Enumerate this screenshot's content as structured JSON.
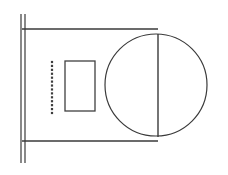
{
  "drawing": {
    "title": "Technical line drawing",
    "canvas": {
      "width": 228,
      "height": 175,
      "background_color": "#ffffff"
    },
    "line_color": "#3a3a3a",
    "shapes": {
      "wall": {
        "name": "double vertical line",
        "line_1_x": 21,
        "line_2_x": 25,
        "y_top": 14,
        "y_bottom": 163,
        "stroke_width": 1.2
      },
      "top_rail": {
        "name": "upper horizontal line",
        "x_start": 22,
        "x_end": 158,
        "y": 29,
        "stroke_width": 1.3
      },
      "bottom_rail": {
        "name": "lower horizontal line",
        "x_start": 22,
        "x_end": 158,
        "y": 141,
        "stroke_width": 1.3
      },
      "circle": {
        "name": "large circle",
        "center_x": 156,
        "center_y": 85,
        "radius": 51,
        "stroke_width": 1.2
      },
      "chord": {
        "name": "vertical chord line through circle",
        "x": 158,
        "y_top": 34,
        "y_bottom": 137,
        "stroke_width": 1.4
      },
      "inner_rectangle": {
        "name": "small rectangle",
        "x": 65,
        "y": 61,
        "width": 30,
        "height": 50,
        "stroke_width": 1.3
      },
      "dot_column": {
        "name": "vertical dotted column",
        "x": 52,
        "y_start": 62,
        "y_end": 113,
        "dot_count": 14,
        "dot_size": 2.2,
        "color": "#3d3d3d"
      }
    }
  }
}
